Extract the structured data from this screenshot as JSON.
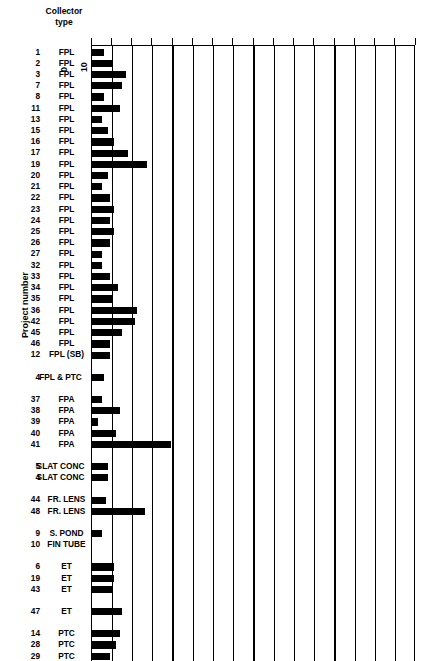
{
  "header": {
    "collector_type_line1": "Collector",
    "collector_type_line2": "type"
  },
  "y_axis_title": "Project number",
  "chart_data": {
    "type": "bar",
    "orientation": "horizontal",
    "title": "",
    "xlabel": "",
    "ylabel": "Project number",
    "xlim": [
      0,
      160
    ],
    "xticks": [
      0,
      10,
      20,
      30,
      40,
      50,
      60,
      70,
      80,
      90,
      100,
      110,
      120,
      130,
      140,
      150,
      160
    ],
    "xtick_labels": [
      "0",
      "10",
      "20",
      "30",
      "40",
      "50",
      "60",
      "70",
      "80",
      "90",
      "100",
      "110",
      "120",
      "130",
      "140",
      "150",
      "160"
    ],
    "grid": true,
    "grid_axis": "x",
    "legend": false,
    "bar_color": "#000000",
    "group_header": "Collector type",
    "categories": [
      "1",
      "2",
      "3",
      "7",
      "8",
      "11",
      "13",
      "15",
      "16",
      "17",
      "19",
      "20",
      "21",
      "22",
      "23",
      "24",
      "25",
      "26",
      "27",
      "32",
      "33",
      "34",
      "35",
      "36",
      "42",
      "45",
      "46",
      "12",
      "4",
      "37",
      "38",
      "39",
      "40",
      "41",
      "5",
      "4",
      "44",
      "48",
      "9",
      "10",
      "6",
      "19",
      "43",
      "47",
      "14",
      "28",
      "29",
      "30",
      "31"
    ],
    "collector_types": [
      "FPL",
      "FPL",
      "FPL",
      "FPL",
      "FPL",
      "FPL",
      "FPL",
      "FPL",
      "FPL",
      "FPL",
      "FPL",
      "FPL",
      "FPL",
      "FPL",
      "FPL",
      "FPL",
      "FPL",
      "FPL",
      "FPL",
      "FPL",
      "FPL",
      "FPL",
      "FPL",
      "FPL",
      "FPL",
      "FPL",
      "FPL",
      "FPL (SB)",
      "FPL & PTC",
      "FPA",
      "FPA",
      "FPA",
      "FPA",
      "FPA",
      "SLAT CONC",
      "SLAT CONC",
      "FR. LENS",
      "FR. LENS",
      "S. POND",
      "FIN TUBE",
      "ET",
      "ET",
      "ET",
      "ET",
      "PTC",
      "PTC",
      "PTC",
      "PTC",
      "PTC"
    ],
    "values": [
      6,
      10,
      17,
      15,
      6,
      14,
      5,
      8,
      11,
      18,
      27,
      8,
      5,
      9,
      11,
      9,
      11,
      9,
      5,
      5,
      9,
      13,
      10,
      22,
      21,
      15,
      9,
      9,
      6,
      5,
      14,
      3,
      12,
      39,
      8,
      8,
      7,
      26,
      5,
      0,
      11,
      11,
      10,
      15,
      14,
      12,
      9,
      11,
      13
    ],
    "rows": [
      {
        "num": "1",
        "type": "FPL",
        "value": 6,
        "gap_before": 0
      },
      {
        "num": "2",
        "type": "FPL",
        "value": 10,
        "gap_before": 0
      },
      {
        "num": "3",
        "type": "FPL",
        "value": 17,
        "gap_before": 0
      },
      {
        "num": "7",
        "type": "FPL",
        "value": 15,
        "gap_before": 0
      },
      {
        "num": "8",
        "type": "FPL",
        "value": 6,
        "gap_before": 0
      },
      {
        "num": "11",
        "type": "FPL",
        "value": 14,
        "gap_before": 0
      },
      {
        "num": "13",
        "type": "FPL",
        "value": 5,
        "gap_before": 0
      },
      {
        "num": "15",
        "type": "FPL",
        "value": 8,
        "gap_before": 0
      },
      {
        "num": "16",
        "type": "FPL",
        "value": 11,
        "gap_before": 0
      },
      {
        "num": "17",
        "type": "FPL",
        "value": 18,
        "gap_before": 0
      },
      {
        "num": "19",
        "type": "FPL",
        "value": 27,
        "gap_before": 0
      },
      {
        "num": "20",
        "type": "FPL",
        "value": 8,
        "gap_before": 0
      },
      {
        "num": "21",
        "type": "FPL",
        "value": 5,
        "gap_before": 0
      },
      {
        "num": "22",
        "type": "FPL",
        "value": 9,
        "gap_before": 0
      },
      {
        "num": "23",
        "type": "FPL",
        "value": 11,
        "gap_before": 0
      },
      {
        "num": "24",
        "type": "FPL",
        "value": 9,
        "gap_before": 0
      },
      {
        "num": "25",
        "type": "FPL",
        "value": 11,
        "gap_before": 0
      },
      {
        "num": "26",
        "type": "FPL",
        "value": 9,
        "gap_before": 0
      },
      {
        "num": "27",
        "type": "FPL",
        "value": 5,
        "gap_before": 0
      },
      {
        "num": "32",
        "type": "FPL",
        "value": 5,
        "gap_before": 0
      },
      {
        "num": "33",
        "type": "FPL",
        "value": 9,
        "gap_before": 0
      },
      {
        "num": "34",
        "type": "FPL",
        "value": 13,
        "gap_before": 0
      },
      {
        "num": "35",
        "type": "FPL",
        "value": 10,
        "gap_before": 0
      },
      {
        "num": "36",
        "type": "FPL",
        "value": 22,
        "gap_before": 0
      },
      {
        "num": "42",
        "type": "FPL",
        "value": 21,
        "gap_before": 0
      },
      {
        "num": "45",
        "type": "FPL",
        "value": 15,
        "gap_before": 0
      },
      {
        "num": "46",
        "type": "FPL",
        "value": 9,
        "gap_before": 0
      },
      {
        "num": "12",
        "type": "FPL (SB)",
        "value": 9,
        "gap_before": 0
      },
      {
        "num": "4",
        "type": "FPL & PTC",
        "value": 6,
        "gap_before": 11
      },
      {
        "num": "37",
        "type": "FPA",
        "value": 5,
        "gap_before": 11
      },
      {
        "num": "38",
        "type": "FPA",
        "value": 14,
        "gap_before": 0
      },
      {
        "num": "39",
        "type": "FPA",
        "value": 3,
        "gap_before": 0
      },
      {
        "num": "40",
        "type": "FPA",
        "value": 12,
        "gap_before": 0
      },
      {
        "num": "41",
        "type": "FPA",
        "value": 39,
        "gap_before": 0
      },
      {
        "num": "5",
        "type": "SLAT CONC",
        "value": 8,
        "gap_before": 11
      },
      {
        "num": "4",
        "type": "SLAT CONC",
        "value": 8,
        "gap_before": 0
      },
      {
        "num": "44",
        "type": "FR. LENS",
        "value": 7,
        "gap_before": 11
      },
      {
        "num": "48",
        "type": "FR. LENS",
        "value": 26,
        "gap_before": 0
      },
      {
        "num": "9",
        "type": "S. POND",
        "value": 5,
        "gap_before": 11
      },
      {
        "num": "10",
        "type": "FIN TUBE",
        "value": 0,
        "gap_before": 0
      },
      {
        "num": "6",
        "type": "ET",
        "value": 11,
        "gap_before": 11
      },
      {
        "num": "19",
        "type": "ET",
        "value": 11,
        "gap_before": 0
      },
      {
        "num": "43",
        "type": "ET",
        "value": 10,
        "gap_before": 0
      },
      {
        "num": "47",
        "type": "ET",
        "value": 15,
        "gap_before": 11
      },
      {
        "num": "14",
        "type": "PTC",
        "value": 14,
        "gap_before": 11
      },
      {
        "num": "28",
        "type": "PTC",
        "value": 12,
        "gap_before": 0
      },
      {
        "num": "29",
        "type": "PTC",
        "value": 9,
        "gap_before": 0
      },
      {
        "num": "30",
        "type": "PTC",
        "value": 11,
        "gap_before": 0
      },
      {
        "num": "31",
        "type": "PTC",
        "value": 13,
        "gap_before": 0
      }
    ]
  }
}
